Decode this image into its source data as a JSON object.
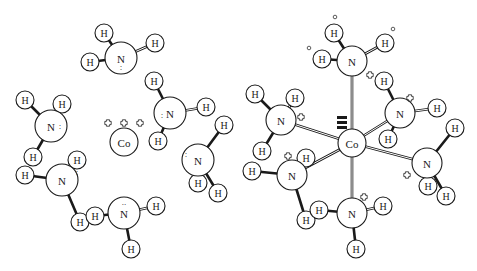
{
  "diagram": {
    "left_panel": {
      "description": "Co3+ ion surrounded by six free NH3 molecules",
      "cobalt": {
        "label": "Co",
        "x": 124,
        "y": 142,
        "charge": "+++"
      },
      "charge_signs": [
        {
          "x": 108,
          "y": 123
        },
        {
          "x": 124,
          "y": 123
        },
        {
          "x": 140,
          "y": 123
        }
      ],
      "ammonia": [
        {
          "n": {
            "x": 121,
            "y": 58,
            "lone": ":",
            "lone_dx": 0,
            "lone_dy": 9
          },
          "h": [
            {
              "x": 104,
              "y": 33
            },
            {
              "x": 155,
              "y": 43
            },
            {
              "x": 90,
              "y": 62
            }
          ]
        },
        {
          "n": {
            "x": 51,
            "y": 126,
            "lone": ":",
            "lone_dx": 9,
            "lone_dy": 0
          },
          "h": [
            {
              "x": 25,
              "y": 100
            },
            {
              "x": 62,
              "y": 104
            },
            {
              "x": 33,
              "y": 157
            }
          ]
        },
        {
          "n": {
            "x": 170,
            "y": 113,
            "lone": ":",
            "lone_dx": -8,
            "lone_dy": 2
          },
          "h": [
            {
              "x": 154,
              "y": 81
            },
            {
              "x": 206,
              "y": 107
            },
            {
              "x": 158,
              "y": 141
            }
          ]
        },
        {
          "n": {
            "x": 198,
            "y": 160,
            "lone": ":",
            "lone_dx": -12,
            "lone_dy": -6
          },
          "h": [
            {
              "x": 224,
              "y": 125
            },
            {
              "x": 198,
              "y": 183
            },
            {
              "x": 218,
              "y": 193
            }
          ]
        },
        {
          "n": {
            "x": 62,
            "y": 180,
            "lone": ":",
            "lone_dx": 15,
            "lone_dy": -8
          },
          "h": [
            {
              "x": 25,
              "y": 175
            },
            {
              "x": 77,
              "y": 160
            },
            {
              "x": 80,
              "y": 222
            }
          ]
        },
        {
          "n": {
            "x": 124,
            "y": 213,
            "lone": "..",
            "lone_dx": 0,
            "lone_dy": -11
          },
          "h": [
            {
              "x": 95,
              "y": 216
            },
            {
              "x": 156,
              "y": 206
            },
            {
              "x": 131,
              "y": 249
            }
          ]
        }
      ]
    },
    "right_panel": {
      "description": "Hexaamminecobalt(III) complex [Co(NH3)6]3+",
      "cobalt": {
        "label": "Co",
        "x": 352,
        "y": 143
      },
      "triple_bar_marker": {
        "x": 342,
        "y": 118
      },
      "ammine": [
        {
          "n": {
            "x": 352,
            "y": 61
          },
          "h": [
            {
              "x": 334,
              "y": 33
            },
            {
              "x": 385,
              "y": 43
            },
            {
              "x": 322,
              "y": 59
            }
          ],
          "charge": {
            "x": 370,
            "y": 75
          },
          "dots": [
            {
              "x": 335,
              "y": 17
            },
            {
              "x": 393,
              "y": 29
            },
            {
              "x": 309,
              "y": 48
            }
          ]
        },
        {
          "n": {
            "x": 281,
            "y": 120
          },
          "h": [
            {
              "x": 255,
              "y": 94
            },
            {
              "x": 295,
              "y": 98
            },
            {
              "x": 262,
              "y": 151
            }
          ],
          "charge": {
            "x": 301,
            "y": 117
          }
        },
        {
          "n": {
            "x": 400,
            "y": 113
          },
          "h": [
            {
              "x": 384,
              "y": 81
            },
            {
              "x": 437,
              "y": 108
            },
            {
              "x": 388,
              "y": 139
            }
          ],
          "charge": {
            "x": 410,
            "y": 98
          }
        },
        {
          "n": {
            "x": 427,
            "y": 163
          },
          "h": [
            {
              "x": 455,
              "y": 128
            },
            {
              "x": 428,
              "y": 186
            },
            {
              "x": 446,
              "y": 196
            }
          ],
          "charge": {
            "x": 407,
            "y": 175
          }
        },
        {
          "n": {
            "x": 292,
            "y": 175
          },
          "h": [
            {
              "x": 252,
              "y": 171
            },
            {
              "x": 306,
              "y": 158
            },
            {
              "x": 306,
              "y": 220
            }
          ],
          "charge": {
            "x": 288,
            "y": 156
          }
        },
        {
          "n": {
            "x": 352,
            "y": 213
          },
          "h": [
            {
              "x": 319,
              "y": 210
            },
            {
              "x": 383,
              "y": 206
            },
            {
              "x": 356,
              "y": 249
            }
          ],
          "charge": {
            "x": 364,
            "y": 197
          }
        }
      ]
    },
    "labels": {
      "nitrogen": "N",
      "hydrogen": "H",
      "cobalt": "Co"
    }
  }
}
